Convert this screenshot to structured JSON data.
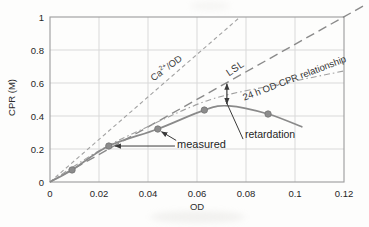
{
  "labels": {
    "ca": {
      "pre": "Ca",
      "sup": "2+",
      "post": "/OD"
    },
    "lsl": "LSL",
    "relationship": "24 h OD-CPR relationship",
    "measured": "measured",
    "retardation": "retardation"
  },
  "colors": {
    "grid": "#d9d9d9",
    "border": "#9c9c9c",
    "tick_text": "#262626",
    "annotation": "#3a3a3a"
  },
  "chart_data": {
    "type": "line",
    "title": "",
    "xlabel": "OD",
    "ylabel": "CPR (M)",
    "xlim": [
      0,
      0.12
    ],
    "ylim": [
      0,
      1
    ],
    "grid": true,
    "x_ticks": [
      "0",
      "0.02",
      "0.04",
      "0.06",
      "0.08",
      "0.1",
      "0.12"
    ],
    "x_tick_values": [
      0,
      0.02,
      0.04,
      0.06,
      0.08,
      0.1,
      0.12
    ],
    "y_ticks": [
      "0",
      "0.2",
      "0.4",
      "0.6",
      "0.8",
      "1"
    ],
    "y_tick_values": [
      0,
      0.2,
      0.4,
      0.6,
      0.8,
      1
    ],
    "series": [
      {
        "name": "Ca2+/OD",
        "style": "short-dash",
        "color": "#a2a2a2",
        "width": 1.1,
        "points": [
          [
            0,
            0
          ],
          [
            0.0776,
            1.0
          ]
        ]
      },
      {
        "name": "LSL",
        "style": "long-dash",
        "color": "#8a8a8a",
        "width": 1.4,
        "points": [
          [
            0,
            0
          ],
          [
            0.1285,
            1.072
          ]
        ]
      },
      {
        "name": "24 h OD-CPR relationship",
        "style": "dash-dot",
        "color": "#a0a0a0",
        "width": 1.1,
        "points": [
          [
            0,
            0
          ],
          [
            0.02,
            0.19
          ],
          [
            0.037,
            0.315
          ],
          [
            0.065,
            0.497
          ],
          [
            0.094,
            0.594
          ],
          [
            0.12,
            0.673
          ]
        ]
      },
      {
        "name": "measured curve",
        "style": "solid",
        "color": "#8a8a8a",
        "width": 1.7,
        "points": [
          [
            0,
            0
          ],
          [
            0.009,
            0.073
          ],
          [
            0.024,
            0.218
          ],
          [
            0.044,
            0.321
          ],
          [
            0.063,
            0.436
          ],
          [
            0.073,
            0.461
          ],
          [
            0.089,
            0.412
          ],
          [
            0.103,
            0.333
          ]
        ]
      }
    ],
    "scatter": {
      "name": "measured",
      "color": "#8c8c8c",
      "edge": "#757575",
      "radius": 3.2,
      "points": [
        [
          0.009,
          0.073
        ],
        [
          0.024,
          0.218
        ],
        [
          0.044,
          0.321
        ],
        [
          0.063,
          0.436
        ],
        [
          0.089,
          0.412
        ]
      ]
    },
    "annotations": {
      "measured_leaders": [
        {
          "from": [
            0.051,
            0.218
          ],
          "to": [
            0.0265,
            0.218
          ]
        },
        {
          "from": [
            0.0515,
            0.252
          ],
          "to": [
            0.0455,
            0.305
          ]
        }
      ],
      "retardation_leader": {
        "from": [
          0.0788,
          0.26
        ],
        "to": [
          0.0718,
          0.49
        ]
      },
      "retardation_gap_arrow": {
        "od": 0.0722,
        "cpr_from": 0.472,
        "cpr_to": 0.595
      }
    }
  }
}
